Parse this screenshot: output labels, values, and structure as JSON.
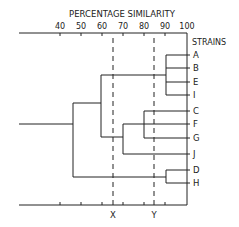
{
  "title": "PERCENTAGE SIMILARITY",
  "strains_label": "STRAINS",
  "axis": {
    "ticks": [
      {
        "label": "40",
        "value": 40
      },
      {
        "label": "50",
        "value": 50
      },
      {
        "label": "60",
        "value": 60
      },
      {
        "label": "70",
        "value": 70
      },
      {
        "label": "80",
        "value": 80
      },
      {
        "label": "90",
        "value": 90
      },
      {
        "label": "100",
        "value": 100
      }
    ]
  },
  "strains": [
    "A",
    "B",
    "E",
    "I",
    "C",
    "F",
    "G",
    "J",
    "D",
    "H"
  ],
  "cut_lines": [
    {
      "label": "X",
      "value": 65
    },
    {
      "label": "Y",
      "value": 85
    }
  ],
  "clusters": [
    {
      "members": [
        "A",
        "B",
        "E",
        "I"
      ],
      "similarity": 90
    },
    {
      "members": [
        "C",
        "F",
        "G"
      ],
      "similarity": 80
    },
    {
      "members": [
        "C",
        "F",
        "G",
        "J"
      ],
      "similarity": 67
    },
    {
      "members": [
        "A",
        "B",
        "E",
        "I",
        "C",
        "F",
        "G",
        "J"
      ],
      "similarity": 62
    },
    {
      "members": [
        "D",
        "H"
      ],
      "similarity": 90
    },
    {
      "members": [
        "A",
        "B",
        "E",
        "I",
        "C",
        "F",
        "G",
        "J",
        "D",
        "H"
      ],
      "similarity": 48
    }
  ],
  "colors": {
    "line": "#222222",
    "background": "#ffffff"
  }
}
